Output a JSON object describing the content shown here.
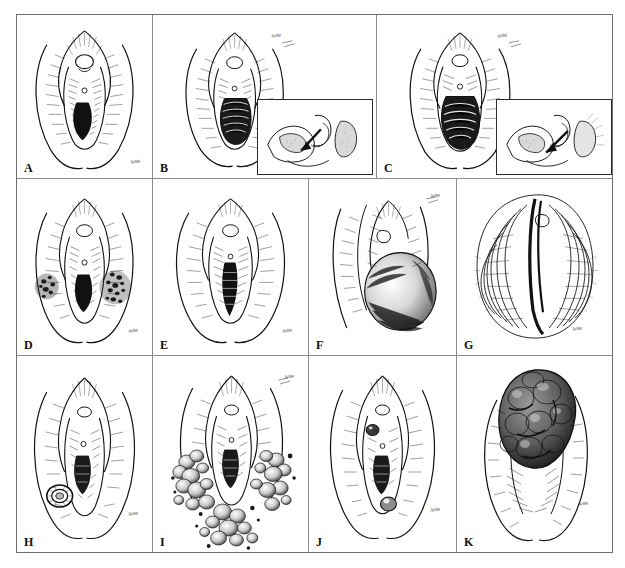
{
  "figure": {
    "panel_count": 11,
    "style": "pen-and-ink line drawing, black on white",
    "colors": {
      "ink": "#111111",
      "paper": "#ffffff",
      "frame": "#6e6e6e",
      "divider": "#8a8a8a"
    },
    "rows": [
      {
        "labels": [
          "A",
          "B",
          "C"
        ]
      },
      {
        "labels": [
          "D",
          "E",
          "F",
          "G"
        ]
      },
      {
        "labels": [
          "H",
          "I",
          "J",
          "K"
        ]
      }
    ]
  },
  "panels": [
    {
      "label": "A",
      "caption": "Normal vulva with patent introitus",
      "signature": "Artist",
      "has_inset": false
    },
    {
      "label": "B",
      "caption": "Introitus with transverse ridges; sagittal inset with arrow",
      "signature": "Artist",
      "has_inset": true,
      "inset_caption": "Sagittal section with directional arrow"
    },
    {
      "label": "C",
      "caption": "Introitus with prominent banding; sagittal inset with arrow",
      "signature": "Artist",
      "has_inset": true,
      "inset_caption": "Sagittal section with directional arrow"
    },
    {
      "label": "D",
      "caption": "Bilateral pigmented macules over labia majora",
      "signature": "Artist",
      "has_inset": false
    },
    {
      "label": "E",
      "caption": "Midline darkened introital column",
      "signature": "Artist",
      "has_inset": false
    },
    {
      "label": "F",
      "caption": "Large rounded protruding mass at the introitus",
      "signature": "Artist",
      "has_inset": false
    },
    {
      "label": "G",
      "caption": "Diffusely wrinkled, rugose vulvar surface",
      "signature": "Artist",
      "has_inset": false
    },
    {
      "label": "H",
      "caption": "Solitary annular lesion on left labium majus",
      "signature": "Artist",
      "has_inset": false
    },
    {
      "label": "I",
      "caption": "Extensive clustered verrucous growths around the vulva and perineum",
      "signature": "Artist",
      "has_inset": false
    },
    {
      "label": "J",
      "caption": "Two discrete nodules at the introital margins",
      "signature": "Artist",
      "has_inset": false
    },
    {
      "label": "K",
      "caption": "Large exophytic lobulated mass replacing the upper vulva",
      "signature": "Artist",
      "has_inset": false
    }
  ]
}
